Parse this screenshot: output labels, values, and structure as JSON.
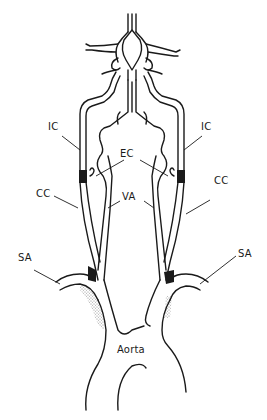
{
  "figure": {
    "type": "anatomical line drawing"
  },
  "labels": {
    "ic_left": "IC",
    "ic_right": "IC",
    "ec": "EC",
    "cc_left": "CC",
    "cc_right": "CC",
    "va": "VA",
    "sa_left": "SA",
    "sa_right": "SA",
    "aorta": "Aorta"
  },
  "colors": {
    "ink": "#1a1a1a",
    "background": "#ffffff"
  }
}
